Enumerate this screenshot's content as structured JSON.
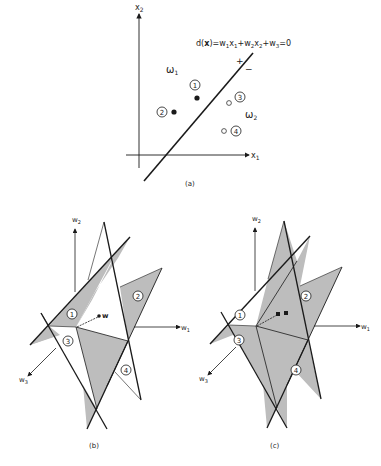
{
  "figure": {
    "panel_a": {
      "label": "(a)",
      "axis_x": "x",
      "axis_x_sub": "1",
      "axis_y": "x",
      "axis_y_sub": "2",
      "equation": "d(x) = w1x1 + w2x2 + w3 = 0",
      "equation_parts": [
        "d(",
        "x",
        ")=w",
        "1",
        "x",
        "1",
        "+w",
        "2",
        "x",
        "2",
        "+w",
        "3",
        "=0"
      ],
      "plus_sign": "+",
      "minus_sign": "−",
      "class_1": "ω",
      "class_1_sub": "1",
      "class_2": "ω",
      "class_2_sub": "2",
      "points": [
        {
          "id": "1",
          "class": "omega1",
          "filled": true
        },
        {
          "id": "2",
          "class": "omega1",
          "filled": true
        },
        {
          "id": "3",
          "class": "omega2",
          "filled": false
        },
        {
          "id": "4",
          "class": "omega2",
          "filled": false
        }
      ]
    },
    "panel_b": {
      "label": "(b)",
      "axis_w1": "w",
      "axis_w1_sub": "1",
      "axis_w2": "w",
      "axis_w2_sub": "2",
      "axis_w3": "w",
      "axis_w3_sub": "3",
      "vector_label": "w",
      "regions": [
        "1",
        "2",
        "3",
        "4"
      ]
    },
    "panel_c": {
      "label": "(c)",
      "axis_w1": "w",
      "axis_w1_sub": "1",
      "axis_w2": "w",
      "axis_w2_sub": "2",
      "axis_w3": "w",
      "axis_w3_sub": "3",
      "regions": [
        "1",
        "2",
        "3",
        "4"
      ]
    },
    "colors": {
      "ink": "#1a1a1a",
      "shade": "#bdbdbd",
      "background": "#ffffff"
    }
  }
}
